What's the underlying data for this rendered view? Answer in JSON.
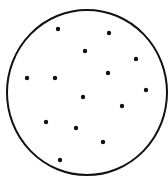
{
  "diagram": {
    "type": "dots-in-circle",
    "background": "#ffffff",
    "stroke_color": "#111111",
    "circle": {
      "cx": 87,
      "cy": 92.5,
      "rx": 80,
      "ry": 82.5,
      "stroke_width": 2
    },
    "dot_radius": 2.2,
    "dot_count": 14,
    "dots": [
      {
        "x": 58,
        "y": 29
      },
      {
        "x": 109,
        "y": 33
      },
      {
        "x": 85,
        "y": 51
      },
      {
        "x": 136,
        "y": 59
      },
      {
        "x": 108,
        "y": 73
      },
      {
        "x": 27,
        "y": 78
      },
      {
        "x": 55,
        "y": 78
      },
      {
        "x": 146,
        "y": 90
      },
      {
        "x": 83,
        "y": 97
      },
      {
        "x": 122,
        "y": 106
      },
      {
        "x": 46,
        "y": 122
      },
      {
        "x": 76,
        "y": 128
      },
      {
        "x": 103,
        "y": 142
      },
      {
        "x": 60,
        "y": 160
      }
    ]
  }
}
